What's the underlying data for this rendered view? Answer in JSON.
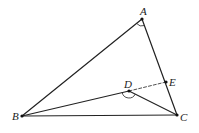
{
  "diagram": {
    "type": "geometry-triangle",
    "points": {
      "A": {
        "label": "A",
        "x": 142,
        "y": 19,
        "lx": 140,
        "ly": 15
      },
      "B": {
        "label": "B",
        "x": 22,
        "y": 116,
        "lx": 12,
        "ly": 120
      },
      "C": {
        "label": "C",
        "x": 177,
        "y": 115,
        "lx": 180,
        "ly": 121
      },
      "D": {
        "label": "D",
        "x": 129,
        "y": 91,
        "lx": 124,
        "ly": 88
      },
      "E": {
        "label": "E",
        "x": 166,
        "y": 82,
        "lx": 169,
        "ly": 86
      }
    },
    "segments": [
      {
        "from": "A",
        "to": "B",
        "style": "solid"
      },
      {
        "from": "A",
        "to": "C",
        "style": "solid"
      },
      {
        "from": "B",
        "to": "C",
        "style": "solid"
      },
      {
        "from": "B",
        "to": "D",
        "style": "solid"
      },
      {
        "from": "D",
        "to": "C",
        "style": "solid"
      },
      {
        "from": "D",
        "to": "E",
        "style": "dashed"
      }
    ],
    "angle_marks": [
      {
        "vertex": "A",
        "between": [
          "B",
          "C"
        ]
      },
      {
        "vertex": "D",
        "between": [
          "B",
          "C"
        ]
      }
    ],
    "colors": {
      "line": "#222222",
      "point": "#111111"
    }
  }
}
